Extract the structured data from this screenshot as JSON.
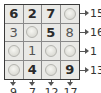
{
  "puzzle": {
    "grid": [
      [
        {
          "value": "6",
          "type": "given"
        },
        {
          "value": "2",
          "type": "given"
        },
        {
          "value": "7",
          "type": "given"
        },
        {
          "value": "",
          "type": "circle"
        }
      ],
      [
        {
          "value": "3",
          "type": "entered"
        },
        {
          "value": "",
          "type": "circle"
        },
        {
          "value": "5",
          "type": "given"
        },
        {
          "value": "8",
          "type": "entered"
        }
      ],
      [
        {
          "value": "",
          "type": "circle"
        },
        {
          "value": "1",
          "type": "entered"
        },
        {
          "value": "",
          "type": "circle"
        },
        {
          "value": "",
          "type": "circle"
        }
      ],
      [
        {
          "value": "",
          "type": "circle"
        },
        {
          "value": "4",
          "type": "given"
        },
        {
          "value": "",
          "type": "circle"
        },
        {
          "value": "9",
          "type": "given"
        }
      ]
    ],
    "row_clues": [
      "15",
      "16",
      "1",
      "13"
    ],
    "col_clues": [
      "9",
      "7",
      "12",
      "17"
    ],
    "colors": {
      "cell_bg": "#e9e9e6",
      "border": "#3a3a3a",
      "text": "#222222"
    }
  }
}
